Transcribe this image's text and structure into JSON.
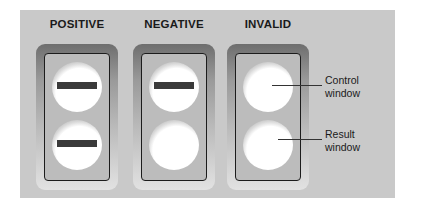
{
  "diagram": {
    "panels": [
      {
        "title": "POSITIVE",
        "control_line": true,
        "result_line": true
      },
      {
        "title": "NEGATIVE",
        "control_line": true,
        "result_line": false
      },
      {
        "title": "INVALID",
        "control_line": false,
        "result_line": false
      }
    ],
    "labels": {
      "control": "Control window",
      "control_l1": "Control",
      "control_l2": "window",
      "result": "Result window",
      "result_l1": "Result",
      "result_l2": "window"
    },
    "colors": {
      "background": "#c9c9c9",
      "line": "#3a3a3a"
    }
  }
}
